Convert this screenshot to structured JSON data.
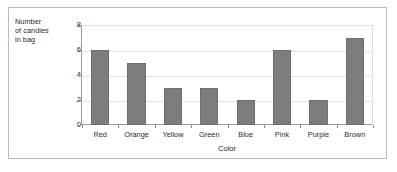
{
  "chart_data": {
    "type": "bar",
    "title": "",
    "categories": [
      "Red",
      "Orange",
      "Yellow",
      "Green",
      "Blue",
      "Pink",
      "Purple",
      "Brown"
    ],
    "values": [
      6,
      5,
      3,
      3,
      2,
      6,
      2,
      7
    ],
    "xlabel": "Color",
    "ylabel": "Number\nof candies\nin bag",
    "ylim": [
      0,
      8
    ],
    "yticks": [
      0,
      2,
      4,
      6,
      8
    ],
    "ytick_labels": [
      "0",
      "2",
      "4",
      "6",
      "8"
    ],
    "grid": true,
    "grid_axis": "y",
    "legend": false,
    "bar_color": "#7d7d7d",
    "bar_edge_color": "#6e6e6e",
    "axis_color": "#9a9a9a",
    "gridline_color": "#e2e2e2",
    "frame_color": "#b9b9b9",
    "background": "#ffffff"
  }
}
